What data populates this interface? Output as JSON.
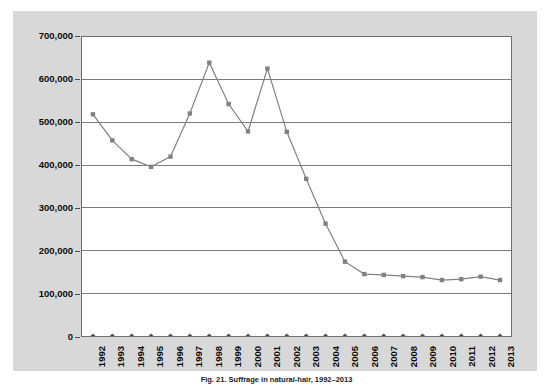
{
  "chart_data": {
    "type": "line",
    "title": "",
    "xlabel": "",
    "ylabel": "",
    "ylim": [
      0,
      700000
    ],
    "ytick_labels": [
      "700,000",
      "600,000",
      "500,000",
      "400,000",
      "300,000",
      "200,000",
      "100,000",
      "0"
    ],
    "ytick_values": [
      700000,
      600000,
      500000,
      400000,
      300000,
      200000,
      100000,
      0
    ],
    "grid": true,
    "legend": "none",
    "categories": [
      "1992",
      "1993",
      "1994",
      "1995",
      "1996",
      "1997",
      "1998",
      "1999",
      "2000",
      "2001",
      "2002",
      "2003",
      "2004",
      "2005",
      "2006",
      "2007",
      "2008",
      "2009",
      "2010",
      "2011",
      "2012",
      "2013"
    ],
    "series": [
      {
        "name": "series-1",
        "marker": "square",
        "color": "#808080",
        "values": [
          519000,
          458000,
          414000,
          396000,
          420000,
          521000,
          640000,
          543000,
          479000,
          626000,
          478000,
          368000,
          263000,
          174000,
          145000,
          143000,
          140000,
          138000,
          131000,
          133000,
          139000,
          131000
        ]
      },
      {
        "name": "series-2",
        "marker": "diamond",
        "color": "#4d4d4d",
        "values": [
          0,
          0,
          0,
          0,
          0,
          0,
          0,
          0,
          0,
          0,
          0,
          0,
          0,
          0,
          0,
          0,
          0,
          0,
          0,
          0,
          0,
          0
        ]
      }
    ]
  },
  "caption": {
    "text": "Fig. 21. Suffrage in natural-hair, 1992–2013"
  },
  "colors": {
    "panel_background": "#d8d8d8",
    "plot_background": "#ffffff",
    "gridline": "#7a7a7a",
    "axis": "#6e6e6e",
    "series_1": "#808080",
    "series_2": "#4d4d4d"
  }
}
